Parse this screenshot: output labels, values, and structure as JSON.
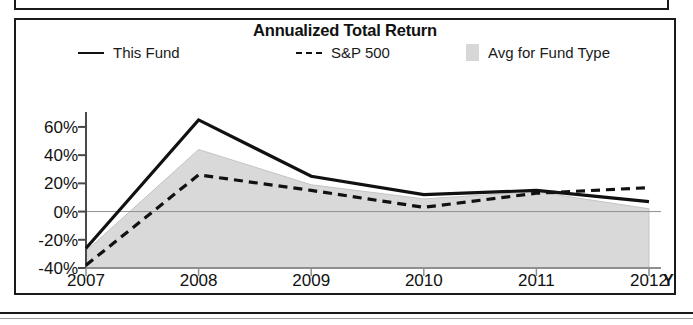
{
  "chart_data": {
    "type": "line",
    "title": "Annualized Total Return",
    "xlabel": "",
    "ylabel": "",
    "categories": [
      "2007",
      "2008",
      "2009",
      "2010",
      "2011",
      "2012"
    ],
    "x_axis_suffix_label": "YTD",
    "x_tick_labels": [
      "2007",
      "2008",
      "2009",
      "2010",
      "2011",
      "2012"
    ],
    "y_tick_labels": [
      "60%",
      "40%",
      "20%",
      "0%",
      "-20%",
      "-40%"
    ],
    "y_tick_values": [
      60,
      40,
      20,
      0,
      -20,
      -40
    ],
    "ylim": [
      -40,
      72
    ],
    "grid": false,
    "legend_position": "top",
    "series": [
      {
        "name": "This Fund",
        "style": "solid",
        "color": "#111111",
        "values": [
          -26,
          65,
          25,
          12,
          15,
          7
        ]
      },
      {
        "name": "S&P 500",
        "style": "dashed",
        "color": "#111111",
        "values": [
          -38,
          26,
          15,
          3,
          13,
          17
        ]
      },
      {
        "name": "Avg for Fund Type",
        "style": "band",
        "color": "#d9d9d9",
        "upper": [
          -28,
          44,
          19,
          9,
          14,
          2
        ],
        "lower": [
          -40,
          -40,
          -40,
          -40,
          -40,
          -40
        ],
        "note": "shaded region between fund-type average and chart floor"
      }
    ],
    "legend": [
      {
        "label": "This Fund",
        "marker": "solid-line"
      },
      {
        "label": "S&P 500",
        "marker": "dashed-line"
      },
      {
        "label": "Avg for Fund Type",
        "marker": "gray-swatch"
      }
    ]
  },
  "chart": {
    "title": "Annualized Total Return"
  },
  "legend": {
    "this_fund": "This Fund",
    "sp500": "S&P 500",
    "avg_for_fund_type": "Avg for Fund Type"
  },
  "axes": {
    "y": {
      "t0": "60%",
      "t1": "40%",
      "t2": "20%",
      "t3": "0%",
      "t4": "-20%",
      "t5": "-40%"
    },
    "x": {
      "t0": "2007",
      "t1": "2008",
      "t2": "2009",
      "t3": "2010",
      "t4": "2011",
      "t5": "2012",
      "ytd": "YTD"
    }
  },
  "colors": {
    "line": "#111111",
    "band": "#d9d9d9",
    "frame": "#1a1a1a",
    "zero_line": "#8f8f8f"
  }
}
